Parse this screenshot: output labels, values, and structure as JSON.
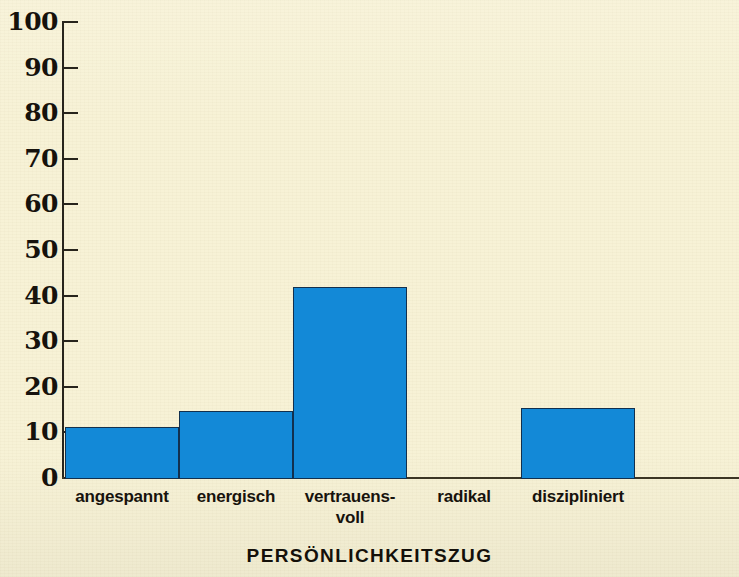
{
  "chart_data": {
    "type": "bar",
    "title": "",
    "xlabel": "PERSÖNLICHKEITSZUG",
    "ylabel": "",
    "categories": [
      "angespannt",
      "energisch",
      "vertrauens-voll",
      "radikal",
      "diszipliniert"
    ],
    "category_lines": [
      [
        "angespannt"
      ],
      [
        "energisch"
      ],
      [
        "vertrauens-",
        "voll"
      ],
      [
        "radikal"
      ],
      [
        "diszipliniert"
      ]
    ],
    "values": [
      11.5,
      15,
      42,
      0,
      15.5
    ],
    "ylim": [
      0,
      100
    ],
    "yticks": [
      0,
      10,
      20,
      30,
      40,
      50,
      60,
      70,
      80,
      90,
      100
    ],
    "ytick_labels": [
      "0",
      "10",
      "20",
      "30",
      "40",
      "50",
      "60",
      "70",
      "80",
      "90",
      "100"
    ],
    "grid": false,
    "legend": "none",
    "bar_color": "#1389d7",
    "bar_border_color": "#12304e",
    "background_color": "#f7f2d6",
    "axis_color": "#27241c",
    "text_color": "#16120c"
  }
}
